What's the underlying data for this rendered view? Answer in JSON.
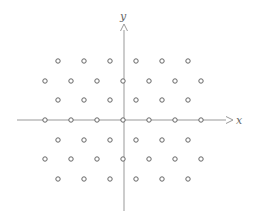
{
  "diagram": {
    "type": "lattice",
    "axes": {
      "x_label": "x",
      "y_label": "y",
      "color": "#888888"
    },
    "point_color": "#666666",
    "rows": [
      {
        "y": 61,
        "xs": [
          58,
          84,
          110,
          136,
          162,
          188
        ]
      },
      {
        "y": 81,
        "xs": [
          45,
          71,
          97,
          123,
          149,
          175,
          201
        ]
      },
      {
        "y": 100,
        "xs": [
          58,
          84,
          110,
          136,
          162,
          188
        ]
      },
      {
        "y": 120,
        "xs": [
          45,
          71,
          97,
          123,
          149,
          175,
          201
        ]
      },
      {
        "y": 140,
        "xs": [
          58,
          84,
          110,
          136,
          162,
          188
        ]
      },
      {
        "y": 159,
        "xs": [
          45,
          71,
          97,
          123,
          149,
          175,
          201
        ]
      },
      {
        "y": 179,
        "xs": [
          58,
          84,
          110,
          136,
          162,
          188
        ]
      }
    ]
  }
}
